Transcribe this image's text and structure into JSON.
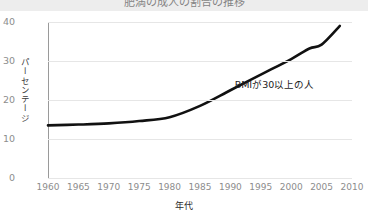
{
  "banner": {
    "title": "肥満の成人の割合の推移"
  },
  "chart_data": {
    "type": "line",
    "title": "肥満の成人の割合の推移",
    "xlabel": "年代",
    "ylabel": "パーセンテージ",
    "xlim": [
      1960,
      2010
    ],
    "ylim": [
      0,
      40
    ],
    "grid": true,
    "legend": null,
    "line_color": "#111111",
    "axis_color": "#9a9a9a",
    "grid_color": "#e6e6e6",
    "yticks": [
      0,
      10,
      20,
      30,
      40
    ],
    "xticks": [
      1960,
      1965,
      1970,
      1975,
      1980,
      1985,
      1990,
      1995,
      2000,
      2005,
      2010
    ],
    "series": [
      {
        "name": "BMIが30以上の人",
        "x": [
          1960,
          1965,
          1970,
          1975,
          1980,
          1985,
          1990,
          1995,
          2000,
          2003,
          2005,
          2008
        ],
        "values": [
          13.5,
          13.7,
          14.0,
          14.6,
          15.6,
          18.5,
          22.5,
          26.5,
          30.5,
          33.2,
          34.2,
          39.0
        ]
      }
    ],
    "annotations": [
      {
        "text": "BMIが30以上の人",
        "x": 1993,
        "y": 22
      }
    ]
  }
}
